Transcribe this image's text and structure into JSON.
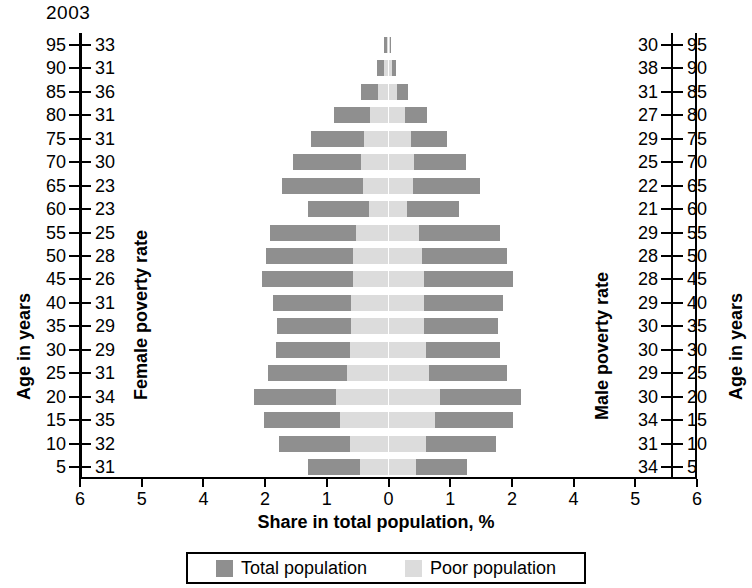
{
  "year": "2003",
  "axis_titles": {
    "age_left": "Age in years",
    "female_rate": "Female poverty rate",
    "male_rate": "Male poverty rate",
    "age_right": "Age in years",
    "x": "Share in total population, %"
  },
  "legend": {
    "total_label": "Total population",
    "poor_label": "Poor population",
    "total_color": "#8f8f8f",
    "poor_color": "#dcdcdc"
  },
  "x_axis": {
    "tick_labels": [
      "6",
      "5",
      "4",
      "2",
      "1",
      "0",
      "1",
      "2",
      "4",
      "5",
      "6"
    ],
    "tick_values": [
      -6,
      -5,
      -4,
      -2,
      -1,
      0,
      1,
      2,
      4,
      5,
      6
    ]
  },
  "chart_data": {
    "type": "bar",
    "title": "2003",
    "subtitle": "Population pyramid with poverty rates",
    "xlabel": "Share in total population, %",
    "ylabel": "Age in years",
    "grid": false,
    "legend_position": "bottom",
    "orientation": "horizontal-diverging",
    "xlim": [
      -6,
      6
    ],
    "x_tick_labels": [
      "6",
      "5",
      "4",
      "2",
      "1",
      "0",
      "1",
      "2",
      "4",
      "5",
      "6"
    ],
    "categories": [
      "95",
      "90",
      "85",
      "80",
      "75",
      "70",
      "65",
      "60",
      "55",
      "50",
      "45",
      "40",
      "35",
      "30",
      "25",
      "20",
      "15",
      "10",
      "5"
    ],
    "series": [
      {
        "name": "Total population",
        "side": "female",
        "values": [
          0.07,
          0.18,
          0.45,
          0.88,
          1.25,
          1.55,
          1.72,
          1.3,
          1.92,
          1.98,
          2.1,
          1.88,
          1.8,
          1.82,
          1.95,
          2.35,
          2.05,
          1.78,
          1.3
        ]
      },
      {
        "name": "Poor population",
        "side": "female",
        "values": [
          0.03,
          0.08,
          0.17,
          0.3,
          0.4,
          0.45,
          0.42,
          0.32,
          0.52,
          0.58,
          0.58,
          0.6,
          0.6,
          0.62,
          0.68,
          0.85,
          0.78,
          0.62,
          0.46
        ]
      },
      {
        "name": "Total population",
        "side": "male",
        "values": [
          0.04,
          0.12,
          0.32,
          0.62,
          0.95,
          1.25,
          1.48,
          1.15,
          1.8,
          1.92,
          2.05,
          1.85,
          1.78,
          1.8,
          1.92,
          2.3,
          2.02,
          1.75,
          1.28
        ]
      },
      {
        "name": "Poor population",
        "side": "male",
        "values": [
          0.02,
          0.06,
          0.14,
          0.26,
          0.36,
          0.42,
          0.4,
          0.3,
          0.5,
          0.55,
          0.57,
          0.58,
          0.58,
          0.6,
          0.66,
          0.84,
          0.76,
          0.6,
          0.45
        ]
      }
    ],
    "female_poverty_rate": [
      33,
      31,
      36,
      31,
      31,
      30,
      23,
      23,
      25,
      28,
      26,
      31,
      29,
      29,
      31,
      34,
      35,
      32,
      31
    ],
    "male_poverty_rate": [
      30,
      38,
      31,
      27,
      29,
      25,
      22,
      21,
      29,
      28,
      28,
      29,
      30,
      30,
      29,
      30,
      34,
      31,
      34
    ]
  },
  "rows": [
    {
      "age": "95",
      "female_rate": "33",
      "male_rate": "30",
      "f_total": 0.07,
      "f_poor": 0.03,
      "m_total": 0.04,
      "m_poor": 0.02
    },
    {
      "age": "90",
      "female_rate": "31",
      "male_rate": "38",
      "f_total": 0.18,
      "f_poor": 0.08,
      "m_total": 0.12,
      "m_poor": 0.06
    },
    {
      "age": "85",
      "female_rate": "36",
      "male_rate": "31",
      "f_total": 0.45,
      "f_poor": 0.17,
      "m_total": 0.32,
      "m_poor": 0.14
    },
    {
      "age": "80",
      "female_rate": "31",
      "male_rate": "27",
      "f_total": 0.88,
      "f_poor": 0.3,
      "m_total": 0.62,
      "m_poor": 0.26
    },
    {
      "age": "75",
      "female_rate": "31",
      "male_rate": "29",
      "f_total": 1.25,
      "f_poor": 0.4,
      "m_total": 0.95,
      "m_poor": 0.36
    },
    {
      "age": "70",
      "female_rate": "30",
      "male_rate": "25",
      "f_total": 1.55,
      "f_poor": 0.45,
      "m_total": 1.25,
      "m_poor": 0.42
    },
    {
      "age": "65",
      "female_rate": "23",
      "male_rate": "22",
      "f_total": 1.72,
      "f_poor": 0.42,
      "m_total": 1.48,
      "m_poor": 0.4
    },
    {
      "age": "60",
      "female_rate": "23",
      "male_rate": "21",
      "f_total": 1.3,
      "f_poor": 0.32,
      "m_total": 1.15,
      "m_poor": 0.3
    },
    {
      "age": "55",
      "female_rate": "25",
      "male_rate": "29",
      "f_total": 1.92,
      "f_poor": 0.52,
      "m_total": 1.8,
      "m_poor": 0.5
    },
    {
      "age": "50",
      "female_rate": "28",
      "male_rate": "28",
      "f_total": 1.98,
      "f_poor": 0.58,
      "m_total": 1.92,
      "m_poor": 0.55
    },
    {
      "age": "45",
      "female_rate": "26",
      "male_rate": "28",
      "f_total": 2.1,
      "f_poor": 0.58,
      "m_total": 2.05,
      "m_poor": 0.57
    },
    {
      "age": "40",
      "female_rate": "31",
      "male_rate": "29",
      "f_total": 1.88,
      "f_poor": 0.6,
      "m_total": 1.85,
      "m_poor": 0.58
    },
    {
      "age": "35",
      "female_rate": "29",
      "male_rate": "30",
      "f_total": 1.8,
      "f_poor": 0.6,
      "m_total": 1.78,
      "m_poor": 0.58
    },
    {
      "age": "30",
      "female_rate": "29",
      "male_rate": "30",
      "f_total": 1.82,
      "f_poor": 0.62,
      "m_total": 1.8,
      "m_poor": 0.6
    },
    {
      "age": "25",
      "female_rate": "31",
      "male_rate": "29",
      "f_total": 1.95,
      "f_poor": 0.68,
      "m_total": 1.92,
      "m_poor": 0.66
    },
    {
      "age": "20",
      "female_rate": "34",
      "male_rate": "30",
      "f_total": 2.35,
      "f_poor": 0.85,
      "m_total": 2.3,
      "m_poor": 0.84
    },
    {
      "age": "15",
      "female_rate": "35",
      "male_rate": "34",
      "f_total": 2.05,
      "f_poor": 0.78,
      "m_total": 2.02,
      "m_poor": 0.76
    },
    {
      "age": "10",
      "female_rate": "32",
      "male_rate": "31",
      "f_total": 1.78,
      "f_poor": 0.62,
      "m_total": 1.75,
      "m_poor": 0.6
    },
    {
      "age": "5",
      "female_rate": "31",
      "male_rate": "34",
      "f_total": 1.3,
      "f_poor": 0.46,
      "m_total": 1.28,
      "m_poor": 0.45
    }
  ]
}
